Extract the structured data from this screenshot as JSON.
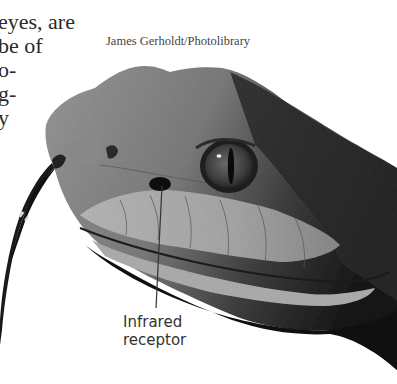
{
  "page": {
    "top_cutoff_text": "",
    "body_text_lines": [
      "eyes, are",
      "be of",
      "o-",
      "g-",
      "y"
    ],
    "photo_credit": "James Gerholdt/Photolibrary"
  },
  "figure": {
    "callout": {
      "label_line1": "Infrared",
      "label_line2": "receptor"
    },
    "colors": {
      "background": "#ffffff",
      "text": "#2a2a2a",
      "leader_line": "#333333"
    }
  }
}
